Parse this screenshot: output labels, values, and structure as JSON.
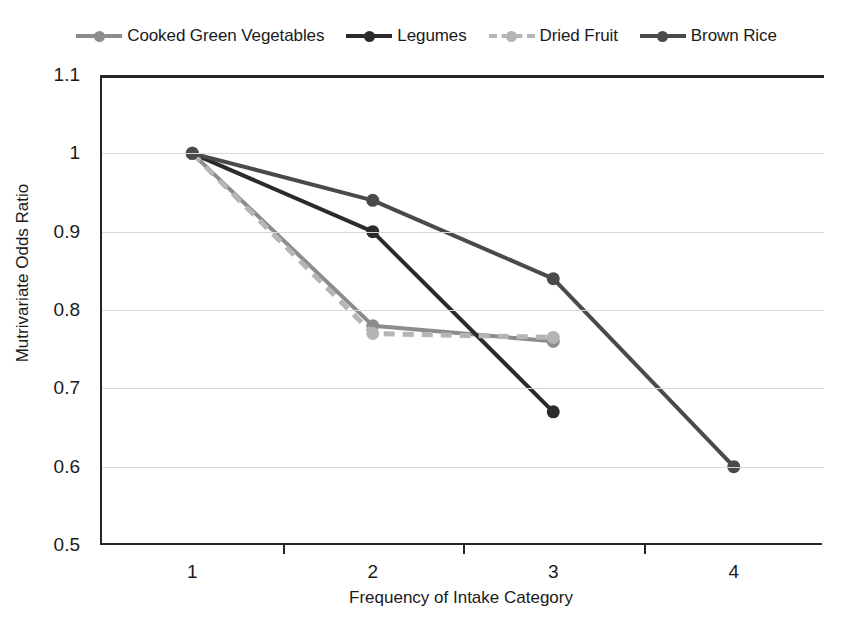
{
  "chart_data": {
    "type": "line",
    "title": "",
    "xlabel": "Frequency of Intake Category",
    "ylabel": "Mutrivariate Odds Ratio",
    "x": [
      1,
      2,
      3,
      4
    ],
    "categories": [
      "1",
      "2",
      "3",
      "4"
    ],
    "xtick_labels": [
      "1",
      "2",
      "3",
      "4"
    ],
    "ytick_labels": [
      "1.1",
      "1",
      "0.9",
      "0.8",
      "0.7",
      "0.6",
      "0.5"
    ],
    "ytick_values": [
      1.1,
      1.0,
      0.9,
      0.8,
      0.7,
      0.6,
      0.5
    ],
    "ylim": [
      0.5,
      1.1
    ],
    "xlim": [
      0.5,
      4.5
    ],
    "grid": "horizontal",
    "legend_position": "top",
    "series": [
      {
        "name": "Cooked Green Vegetables",
        "color": "#8c8c8c",
        "dash": "solid",
        "marker": "circle",
        "x": [
          1,
          2,
          3
        ],
        "values": [
          1.0,
          0.78,
          0.76
        ]
      },
      {
        "name": "Legumes",
        "color": "#2b2b2b",
        "dash": "solid",
        "marker": "circle",
        "x": [
          1,
          2,
          3
        ],
        "values": [
          1.0,
          0.9,
          0.67
        ]
      },
      {
        "name": "Dried Fruit",
        "color": "#b5b5b5",
        "dash": "dashed",
        "marker": "circle",
        "x": [
          1,
          2,
          3
        ],
        "values": [
          1.0,
          0.77,
          0.765
        ]
      },
      {
        "name": "Brown Rice",
        "color": "#4a4a4a",
        "dash": "solid",
        "marker": "circle",
        "x": [
          1,
          2,
          3,
          4
        ],
        "values": [
          1.0,
          0.94,
          0.84,
          0.6
        ]
      }
    ]
  },
  "axes": {
    "y_title": "Mutrivariate Odds Ratio",
    "x_title": "Frequency of Intake Category"
  },
  "colors": {
    "axis": "#262626",
    "grid": "#d8d8d8",
    "background": "#ffffff",
    "text": "#1a1a1a"
  }
}
